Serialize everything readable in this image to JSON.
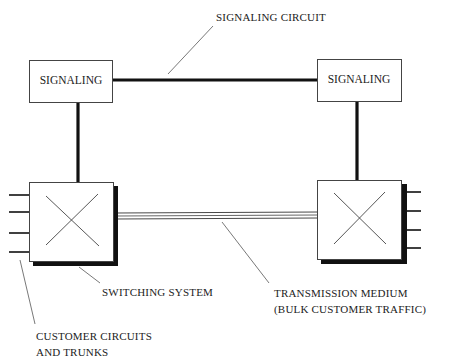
{
  "diagram": {
    "nodes": {
      "signaling_left": {
        "label": "SIGNALING"
      },
      "signaling_right": {
        "label": "SIGNALING"
      },
      "switch_left": {
        "symbol": "x-cross-icon"
      },
      "switch_right": {
        "symbol": "x-cross-icon"
      }
    },
    "labels": {
      "signaling_circuit": "SIGNALING CIRCUIT",
      "switching_system": "SWITCHING SYSTEM",
      "transmission_medium_line1": "TRANSMISSION MEDIUM",
      "transmission_medium_line2": "(BULK CUSTOMER TRAFFIC)",
      "customer_circuits_line1": "CUSTOMER CIRCUITS",
      "customer_circuits_line2": "AND TRUNKS"
    },
    "edges": [
      {
        "from": "signaling_left",
        "to": "signaling_right",
        "label": "SIGNALING CIRCUIT",
        "style": "thick"
      },
      {
        "from": "signaling_left",
        "to": "switch_left",
        "style": "thick"
      },
      {
        "from": "signaling_right",
        "to": "switch_right",
        "style": "thick"
      },
      {
        "from": "switch_left",
        "to": "switch_right",
        "label": "TRANSMISSION MEDIUM (BULK CUSTOMER TRAFFIC)",
        "style": "triple-line"
      }
    ],
    "customer_circuit_stubs_per_switch": 4
  }
}
